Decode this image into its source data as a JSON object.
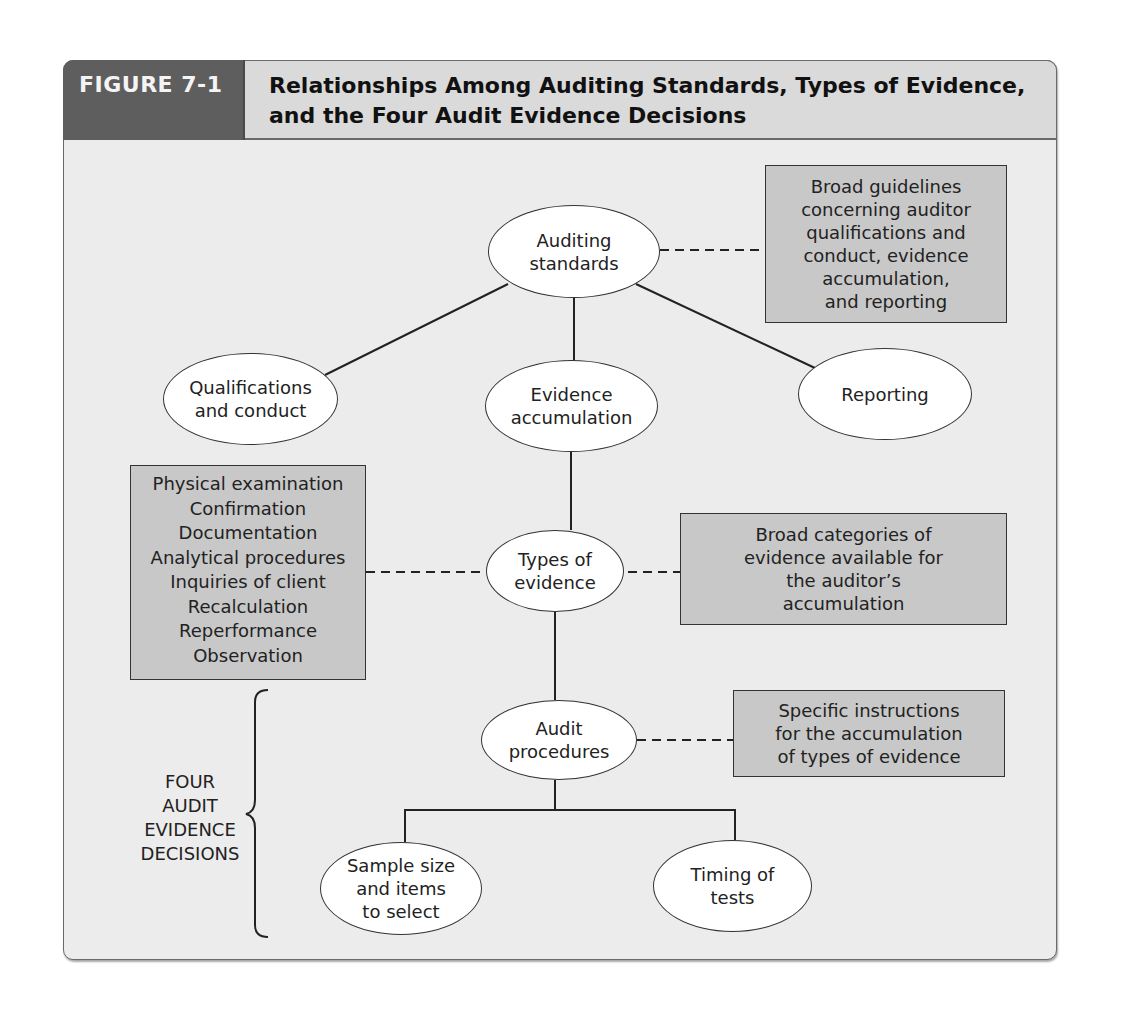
{
  "figure": {
    "label": "FIGURE 7-1",
    "title": "Relationships Among Auditing Standards, Types of Evidence, and the Four Audit Evidence Decisions"
  },
  "nodes": {
    "auditing_standards": "Auditing\nstandards",
    "qualifications": "Qualifications\nand conduct",
    "evidence_accumulation": "Evidence\naccumulation",
    "reporting": "Reporting",
    "types_of_evidence": "Types of\nevidence",
    "audit_procedures": "Audit\nprocedures",
    "sample_size": "Sample size\nand items\nto select",
    "timing": "Timing of\ntests"
  },
  "notes": {
    "standards_note": "Broad guidelines\nconcerning auditor\nqualifications and\nconduct, evidence\naccumulation,\nand reporting",
    "types_note": "Broad categories of\nevidence available for\nthe auditor’s\naccumulation",
    "procedures_note": "Specific instructions\nfor the accumulation\nof types of evidence"
  },
  "evidence_types": [
    "Physical examination",
    "Confirmation",
    "Documentation",
    "Analytical procedures",
    "Inquiries of client",
    "Recalculation",
    "Reperformance",
    "Observation"
  ],
  "decisions_label": [
    "FOUR",
    "AUDIT",
    "EVIDENCE",
    "DECISIONS"
  ],
  "colors": {
    "header_dark": "#5e5e5e",
    "header_light": "#dadada",
    "box_fill": "#c8c8c8",
    "background": "#ececec"
  }
}
